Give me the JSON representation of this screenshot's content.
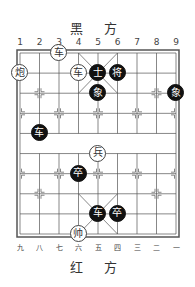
{
  "top_side_label": "黑 方",
  "bottom_side_label": "红 方",
  "top_column_labels": [
    "1",
    "2",
    "3",
    "4",
    "5",
    "6",
    "7",
    "8",
    "9"
  ],
  "bottom_column_labels": [
    "九",
    "八",
    "七",
    "六",
    "五",
    "四",
    "三",
    "二",
    "一"
  ],
  "colors": {
    "red_piece_bg": "#ffffff",
    "black_piece_bg": "#111111",
    "line": "#555555"
  },
  "pieces": [
    {
      "side": "red",
      "char": "车",
      "col": 3,
      "row": 0
    },
    {
      "side": "red",
      "char": "炮",
      "col": 1,
      "row": 1
    },
    {
      "side": "red",
      "char": "车",
      "col": 4,
      "row": 1
    },
    {
      "side": "black",
      "char": "士",
      "col": 5,
      "row": 1
    },
    {
      "side": "black",
      "char": "将",
      "col": 6,
      "row": 1
    },
    {
      "side": "black",
      "char": "象",
      "col": 5,
      "row": 2
    },
    {
      "side": "black",
      "char": "象",
      "col": 9,
      "row": 2
    },
    {
      "side": "black",
      "char": "车",
      "col": 2,
      "row": 4
    },
    {
      "side": "red",
      "char": "兵",
      "col": 5,
      "row": 5
    },
    {
      "side": "black",
      "char": "卒",
      "col": 4,
      "row": 6
    },
    {
      "side": "black",
      "char": "车",
      "col": 5,
      "row": 8
    },
    {
      "side": "black",
      "char": "卒",
      "col": 6,
      "row": 8
    },
    {
      "side": "red",
      "char": "帅",
      "col": 4,
      "row": 9
    }
  ]
}
